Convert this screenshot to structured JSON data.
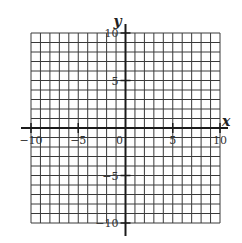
{
  "chart_data": {
    "type": "scatter",
    "title": "",
    "xlabel": "x",
    "ylabel": "y",
    "xlim": [
      -10,
      10
    ],
    "ylim": [
      -10,
      10
    ],
    "grid": true,
    "grid_step": 1,
    "x_ticks": [
      -10,
      -5,
      0,
      5,
      10
    ],
    "y_ticks": [
      -10,
      -5,
      5,
      10
    ],
    "x_tick_labels": [
      "−10",
      "−5",
      "0",
      "5",
      "10"
    ],
    "y_tick_labels": [
      "−10",
      "−5",
      "5",
      "10"
    ],
    "series": [],
    "legend": null
  },
  "colors": {
    "grid": "#3a3a3a",
    "axis": "#1a1a1a",
    "background": "#ffffff"
  }
}
